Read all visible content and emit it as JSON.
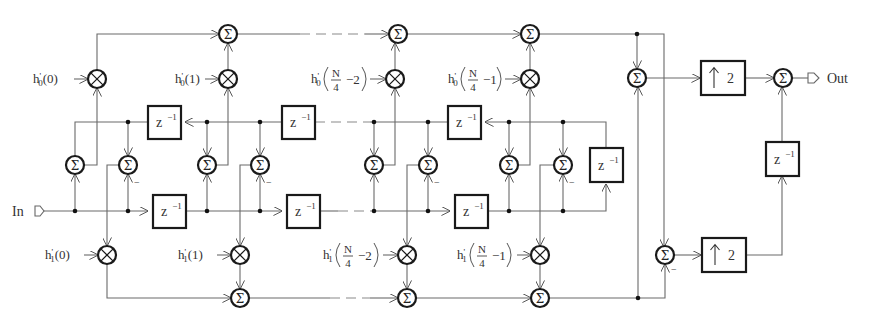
{
  "diagram": {
    "type": "polyphase FIR filter structure with interpolation",
    "input_label": "In",
    "output_label": "Out",
    "sum_symbol": "Σ",
    "mult_symbol": "⊗",
    "delay_label": "z",
    "delay_exp": "−1",
    "upsample_label": "2",
    "upsample_arrow": "↑",
    "minus_sign": "−",
    "top_coeffs": [
      {
        "base": "h",
        "prime": "'",
        "sub": "0",
        "arg": "(0)"
      },
      {
        "base": "h",
        "prime": "'",
        "sub": "0",
        "arg": "(1)"
      },
      {
        "base": "h",
        "prime": "'",
        "sub": "0",
        "frac_num": "N",
        "frac_den": "4",
        "offset": "−2"
      },
      {
        "base": "h",
        "prime": "'",
        "sub": "0",
        "frac_num": "N",
        "frac_den": "4",
        "offset": "−1"
      }
    ],
    "bottom_coeffs": [
      {
        "base": "h",
        "prime": "'",
        "sub": "1",
        "arg": "(0)"
      },
      {
        "base": "h",
        "prime": "'",
        "sub": "1",
        "arg": "(1)"
      },
      {
        "base": "h",
        "prime": "'",
        "sub": "1",
        "frac_num": "N",
        "frac_den": "4",
        "offset": "−2"
      },
      {
        "base": "h",
        "prime": "'",
        "sub": "1",
        "frac_num": "N",
        "frac_den": "4",
        "offset": "−1"
      }
    ]
  },
  "colors": {
    "wire": "#6a6a6a",
    "block_stroke": "#1a1a1a",
    "text": "#333333",
    "background": "#ffffff"
  }
}
